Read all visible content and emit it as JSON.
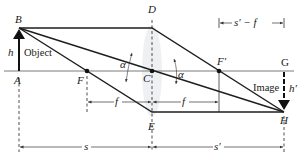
{
  "figure": {
    "type": "thin lens ray diagram",
    "points": {
      "A": "A",
      "B": "B",
      "C": "C",
      "D": "D",
      "E": "E",
      "F": "F",
      "F_prime": "F′",
      "G": "G",
      "H": "H"
    },
    "labels": {
      "object": "Object",
      "object_height": "h",
      "image": "Image",
      "image_height": "h′",
      "angle_left": "α",
      "angle_right": "α"
    },
    "dimensions": {
      "f_left": "f",
      "f_right": "f",
      "s": "s",
      "s_prime": "s′",
      "s_prime_minus_f": "s′ − f"
    }
  }
}
